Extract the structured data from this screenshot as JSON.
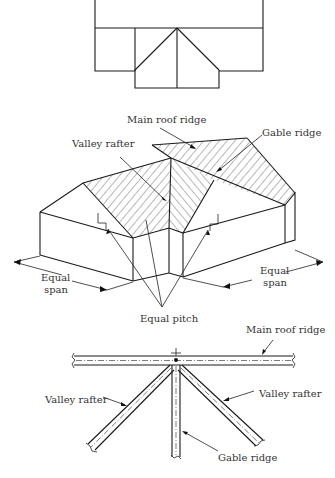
{
  "figure": {
    "top_view": {
      "description": "Plan view of roof with main ridge and gable wing"
    },
    "isometric_view": {
      "labels": {
        "main_roof_ridge": "Main roof ridge",
        "valley_rafter": "Valley rafter",
        "gable_ridge": "Gable ridge",
        "equal_span_left_line1": "Equal",
        "equal_span_left_line2": "span",
        "equal_span_right_line1": "Equal",
        "equal_span_right_line2": "span",
        "equal_pitch": "Equal pitch"
      }
    },
    "framing_detail": {
      "labels": {
        "main_roof_ridge": "Main roof ridge",
        "valley_rafter_left": "Valley rafter",
        "valley_rafter_right": "Valley rafter",
        "gable_ridge": "Gable ridge"
      }
    }
  }
}
